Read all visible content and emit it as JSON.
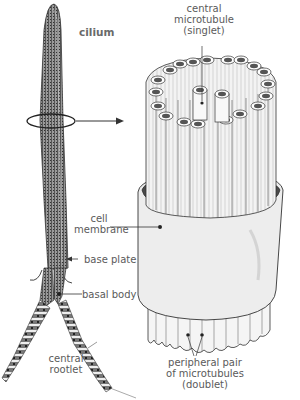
{
  "diagram": {
    "colors": {
      "ink": "#333333",
      "label": "#5a5a5a",
      "membrane_fill": "#ececec",
      "tubule_fill": "#f2f2f2",
      "cilium_fill": "#8a8a8a"
    },
    "labels": {
      "cilium": "cilium",
      "central_microtubule": [
        "central",
        "microtubule",
        "(singlet)"
      ],
      "cell_membrane": [
        "cell",
        "membrane"
      ],
      "base_plate": "base plate",
      "basal_body": "basal body",
      "central_rootlet": [
        "central",
        "rootlet"
      ],
      "peripheral_pair": [
        "peripheral pair",
        "of microtubules",
        "(doublet)"
      ]
    },
    "structure": {
      "outer_doublets": 9,
      "central_singlets": 2,
      "arrangement": "9+2"
    }
  }
}
